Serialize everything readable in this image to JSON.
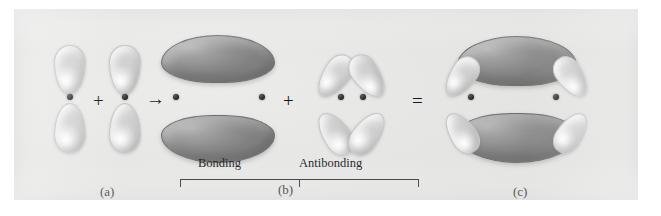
{
  "figure": {
    "type": "molecular-orbital-diagram",
    "background_color": "#e6e6e5",
    "lobe_light_color": "#e2e2e2",
    "lobe_dark_color": "#909090",
    "nucleus_color": "#1b1b1b"
  },
  "panels": [
    {
      "id": "a",
      "label": "(a)",
      "label_x": 100,
      "label_y": 184
    },
    {
      "id": "b",
      "label": "(b)",
      "label_x": 278,
      "label_y": 182
    },
    {
      "id": "c",
      "label": "(c)",
      "label_x": 513,
      "label_y": 184
    }
  ],
  "operators": [
    {
      "name": "plus-sign-1",
      "glyph": "+",
      "x": 93,
      "y": 88
    },
    {
      "name": "arrow-right",
      "glyph": "→",
      "x": 143,
      "y": 88
    },
    {
      "name": "plus-sign-2",
      "glyph": "+",
      "x": 283,
      "y": 88
    },
    {
      "name": "equals-sign",
      "glyph": "=",
      "x": 412,
      "y": 88
    }
  ],
  "bracket": {
    "labels": {
      "bonding": "Bonding",
      "antibonding": "Antibonding"
    },
    "bonding_label_x": 198,
    "antibonding_label_x": 299,
    "label_y": 156,
    "left_x": 166,
    "right_x": 405,
    "mid_x": 285,
    "top_y": 170
  },
  "orbitals": {
    "atomic_p": [
      {
        "name": "p-orbital-left",
        "nucleus_x": 70,
        "nucleus_y": 97
      },
      {
        "name": "p-orbital-right",
        "nucleus_x": 125,
        "nucleus_y": 97
      }
    ],
    "bonding": {
      "name": "pi-bonding-orbital",
      "nuclei": [
        {
          "x": 176,
          "y": 97
        },
        {
          "x": 262,
          "y": 97
        }
      ]
    },
    "antibonding": {
      "name": "pi-antibonding-orbital",
      "nuclei": [
        {
          "x": 341,
          "y": 97
        },
        {
          "x": 363,
          "y": 97
        }
      ]
    },
    "combined": {
      "name": "combined-pi-system",
      "nuclei": [
        {
          "x": 471,
          "y": 97
        },
        {
          "x": 556,
          "y": 97
        }
      ]
    }
  }
}
